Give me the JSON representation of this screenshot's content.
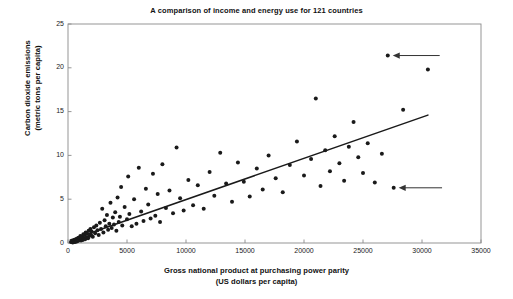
{
  "chart_data": {
    "type": "scatter",
    "title": "A comparison of income and energy use for 121 countries",
    "xlabel_line1": "Gross national product at purchasing power parity",
    "xlabel_line2": "(US dollars per capita)",
    "ylabel_line1": "Carbon dioxide emissions",
    "ylabel_line2": "(metric tons per capita)",
    "xlim": [
      0,
      35000
    ],
    "ylim": [
      0,
      25
    ],
    "xticks": [
      0,
      5000,
      10000,
      15000,
      20000,
      25000,
      30000,
      35000
    ],
    "yticks": [
      0,
      5,
      10,
      15,
      20,
      25
    ],
    "xtick_labels": [
      "0",
      "5000",
      "10000",
      "15000",
      "20000",
      "25000",
      "30000",
      "35000"
    ],
    "ytick_labels": [
      "0",
      "5",
      "10",
      "15",
      "20",
      "25"
    ],
    "grid": false,
    "legend": false,
    "marker_color": "#1a1a1a",
    "marker_size": 2.0,
    "trendline": {
      "label": "regression line",
      "color": "#1a1a1a",
      "x0": 200,
      "y0": 0.35,
      "x1": 30500,
      "y1": 14.6
    },
    "annotations": [
      {
        "name": "upper-arrow",
        "points_to_x": 27100,
        "points_to_y": 21.4,
        "tail_x": 31500,
        "tail_y": 21.4,
        "direction": "left"
      },
      {
        "name": "lower-arrow",
        "points_to_x": 27600,
        "points_to_y": 6.3,
        "tail_x": 31700,
        "tail_y": 6.3,
        "direction": "left"
      }
    ],
    "points": [
      [
        250,
        0.1
      ],
      [
        330,
        0.15
      ],
      [
        400,
        0.05
      ],
      [
        450,
        0.2
      ],
      [
        500,
        0.12
      ],
      [
        560,
        0.3
      ],
      [
        600,
        0.1
      ],
      [
        650,
        0.25
      ],
      [
        700,
        0.4
      ],
      [
        740,
        0.18
      ],
      [
        780,
        0.5
      ],
      [
        820,
        0.22
      ],
      [
        860,
        0.35
      ],
      [
        900,
        0.6
      ],
      [
        950,
        0.3
      ],
      [
        1000,
        0.45
      ],
      [
        1050,
        0.8
      ],
      [
        1100,
        0.28
      ],
      [
        1150,
        0.55
      ],
      [
        1200,
        0.7
      ],
      [
        1250,
        0.35
      ],
      [
        1300,
        1.0
      ],
      [
        1350,
        0.5
      ],
      [
        1400,
        0.9
      ],
      [
        1450,
        0.42
      ],
      [
        1500,
        1.2
      ],
      [
        1550,
        0.65
      ],
      [
        1620,
        1.05
      ],
      [
        1700,
        0.55
      ],
      [
        1750,
        1.4
      ],
      [
        1800,
        0.8
      ],
      [
        1900,
        1.6
      ],
      [
        1950,
        0.95
      ],
      [
        2000,
        1.3
      ],
      [
        2100,
        0.7
      ],
      [
        2200,
        1.8
      ],
      [
        2300,
        1.1
      ],
      [
        2400,
        2.0
      ],
      [
        2500,
        1.45
      ],
      [
        2600,
        0.9
      ],
      [
        2700,
        2.3
      ],
      [
        2800,
        1.6
      ],
      [
        2900,
        3.9
      ],
      [
        3000,
        1.2
      ],
      [
        3100,
        2.6
      ],
      [
        3200,
        1.9
      ],
      [
        3300,
        3.2
      ],
      [
        3400,
        1.5
      ],
      [
        3500,
        2.2
      ],
      [
        3600,
        4.6
      ],
      [
        3700,
        1.7
      ],
      [
        3800,
        2.9
      ],
      [
        3900,
        2.1
      ],
      [
        4000,
        3.5
      ],
      [
        4100,
        1.4
      ],
      [
        4200,
        5.2
      ],
      [
        4300,
        2.4
      ],
      [
        4400,
        3.0
      ],
      [
        4500,
        6.4
      ],
      [
        4600,
        2.0
      ],
      [
        4800,
        4.1
      ],
      [
        5000,
        2.7
      ],
      [
        5100,
        7.6
      ],
      [
        5200,
        3.3
      ],
      [
        5400,
        1.9
      ],
      [
        5600,
        5.0
      ],
      [
        5800,
        2.2
      ],
      [
        6000,
        8.6
      ],
      [
        6200,
        3.6
      ],
      [
        6400,
        2.5
      ],
      [
        6600,
        6.2
      ],
      [
        6800,
        4.4
      ],
      [
        7000,
        2.8
      ],
      [
        7200,
        7.9
      ],
      [
        7400,
        3.1
      ],
      [
        7600,
        5.6
      ],
      [
        7800,
        2.4
      ],
      [
        8000,
        9.0
      ],
      [
        8300,
        4.0
      ],
      [
        8600,
        6.0
      ],
      [
        8900,
        3.4
      ],
      [
        9200,
        10.9
      ],
      [
        9500,
        5.1
      ],
      [
        9800,
        3.7
      ],
      [
        10200,
        7.2
      ],
      [
        10600,
        4.3
      ],
      [
        11000,
        6.6
      ],
      [
        11500,
        3.9
      ],
      [
        12000,
        8.1
      ],
      [
        12400,
        5.4
      ],
      [
        12900,
        10.3
      ],
      [
        13400,
        6.8
      ],
      [
        13900,
        4.7
      ],
      [
        14400,
        9.2
      ],
      [
        14900,
        7.0
      ],
      [
        15400,
        5.3
      ],
      [
        16000,
        8.5
      ],
      [
        16500,
        6.1
      ],
      [
        17000,
        10.0
      ],
      [
        17600,
        7.4
      ],
      [
        18200,
        5.8
      ],
      [
        18800,
        8.9
      ],
      [
        19400,
        11.6
      ],
      [
        20000,
        7.7
      ],
      [
        20600,
        9.6
      ],
      [
        21000,
        16.5
      ],
      [
        21400,
        6.5
      ],
      [
        21800,
        10.6
      ],
      [
        22200,
        8.2
      ],
      [
        22600,
        12.2
      ],
      [
        23000,
        9.1
      ],
      [
        23400,
        7.1
      ],
      [
        23800,
        11.0
      ],
      [
        24200,
        13.8
      ],
      [
        24600,
        9.8
      ],
      [
        25000,
        8.0
      ],
      [
        25400,
        11.4
      ],
      [
        26000,
        6.9
      ],
      [
        26600,
        10.2
      ],
      [
        27100,
        21.4
      ],
      [
        27600,
        6.3
      ],
      [
        28400,
        15.2
      ],
      [
        30500,
        19.8
      ]
    ]
  }
}
